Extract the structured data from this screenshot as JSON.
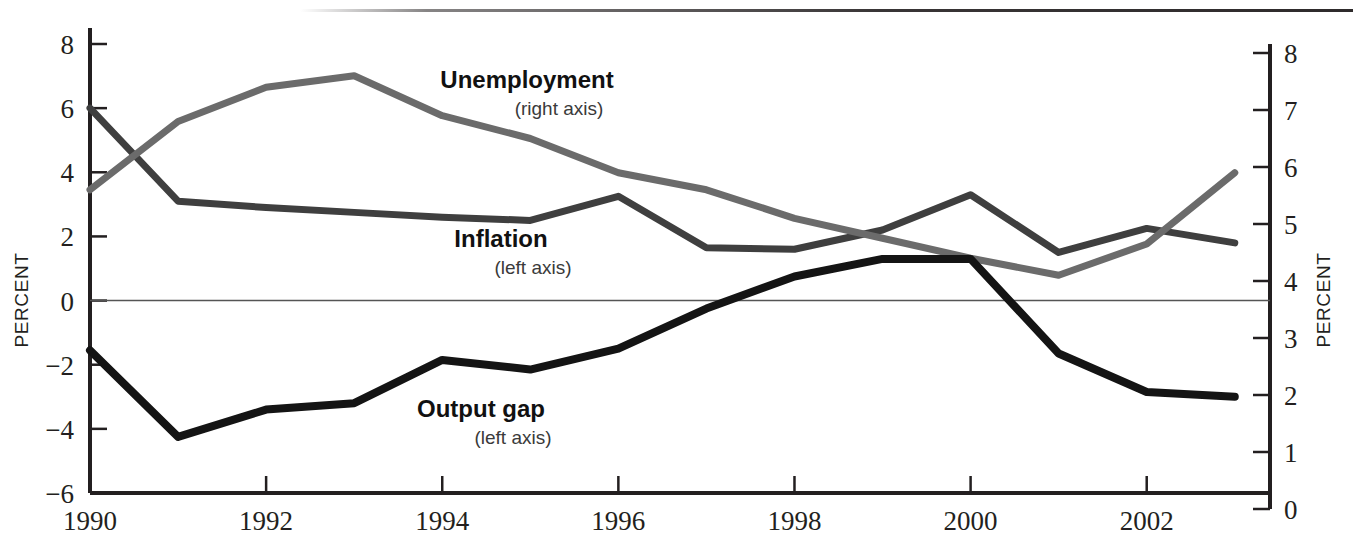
{
  "chart_data": {
    "type": "line",
    "title": "",
    "xlabel": "",
    "ylabel": "PERCENT",
    "y2label": "PERCENT",
    "grid": false,
    "zero_line": true,
    "legend_position": "inline-annotations",
    "x": [
      1990,
      1991,
      1992,
      1993,
      1994,
      1995,
      1996,
      1997,
      1998,
      1999,
      2000,
      2001,
      2002,
      2003
    ],
    "xlim": [
      1990,
      2003.4
    ],
    "xticks": [
      1990,
      1992,
      1994,
      1996,
      1998,
      2000,
      2002
    ],
    "xtick_labels": [
      "1990",
      "1992",
      "1994",
      "1996",
      "1998",
      "2000",
      "2002"
    ],
    "ylim": [
      -6,
      8
    ],
    "yticks": [
      -6,
      -4,
      -2,
      0,
      2,
      4,
      6,
      8
    ],
    "ytick_labels": [
      "−6",
      "−4",
      "−2",
      "0",
      "2",
      "4",
      "6",
      "8"
    ],
    "y2lim": [
      0,
      8
    ],
    "y2ticks": [
      0,
      1,
      2,
      3,
      4,
      5,
      6,
      7,
      8
    ],
    "y2tick_labels": [
      "0",
      "1",
      "2",
      "3",
      "4",
      "5",
      "6",
      "7",
      "8"
    ],
    "series": [
      {
        "name": "Inflation",
        "sublabel": "(left axis)",
        "axis": "left",
        "color": "#3f3f3f",
        "width": 7,
        "values": [
          6.0,
          3.1,
          2.9,
          2.75,
          2.6,
          2.5,
          3.25,
          1.65,
          1.6,
          2.2,
          3.3,
          1.5,
          2.25,
          1.8
        ]
      },
      {
        "name": "Unemployment",
        "sublabel": "(right axis)",
        "axis": "right",
        "color": "#6b6b6b",
        "width": 7,
        "values": [
          5.6,
          6.8,
          7.4,
          7.6,
          6.9,
          6.5,
          5.9,
          5.6,
          5.1,
          4.75,
          4.4,
          4.1,
          4.65,
          5.9
        ]
      },
      {
        "name": "Output gap",
        "sublabel": "(left axis)",
        "axis": "left",
        "color": "#141414",
        "width": 8,
        "values": [
          -1.55,
          -4.25,
          -3.4,
          -3.2,
          -1.85,
          -2.15,
          -1.5,
          -0.25,
          0.75,
          1.3,
          1.3,
          -1.65,
          -2.85,
          -3.0
        ]
      }
    ],
    "annotations": [
      {
        "name": "Unemployment",
        "sub": "(right axis)",
        "x": 527,
        "y": 88
      },
      {
        "name": "Inflation",
        "sub": "(left axis)",
        "x": 501,
        "y": 247
      },
      {
        "name": "Output gap",
        "sub": "(left axis)",
        "x": 481,
        "y": 417
      }
    ]
  }
}
